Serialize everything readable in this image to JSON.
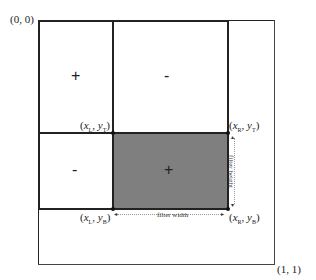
{
  "diagram": {
    "corner_labels": {
      "origin": "(0, 0)",
      "end": "(1, 1)"
    },
    "regions": [
      {
        "id": "top-left",
        "sign": "+"
      },
      {
        "id": "top-right",
        "sign": "-"
      },
      {
        "id": "bottom-left",
        "sign": "-"
      },
      {
        "id": "bottom-right",
        "sign": "+",
        "shaded": true,
        "fill": "#7f7f7f"
      }
    ],
    "points": {
      "top_left": {
        "x": "x",
        "x_sub": "L",
        "y": "y",
        "y_sub": "T"
      },
      "top_right": {
        "x": "x",
        "x_sub": "R",
        "y": "y",
        "y_sub": "T"
      },
      "bottom_left": {
        "x": "x",
        "x_sub": "L",
        "y": "y",
        "y_sub": "B"
      },
      "bottom_right": {
        "x": "x",
        "x_sub": "R",
        "y": "y",
        "y_sub": "B"
      }
    },
    "dimension_labels": {
      "width": "filter width",
      "height": "filter height"
    },
    "colors": {
      "line": "#222222",
      "shade": "#7f7f7f"
    }
  }
}
